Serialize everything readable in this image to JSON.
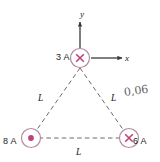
{
  "figure": {
    "background_color": "#ffffff",
    "line_color": "#5a5a5a",
    "symbol_color": "#c2407c",
    "circle_stroke_color": "#b58aa0",
    "text_color": "#1a1a1a",
    "handwriting_color": "#4a4a52"
  },
  "axes": {
    "y_label": "y",
    "x_label": "x",
    "origin_note": "axes originate at the top vertex wire"
  },
  "wires": [
    {
      "id": "top",
      "label": "3 A",
      "current": 3,
      "unit": "A",
      "direction_symbol": "x",
      "direction_meaning": "into the page",
      "position": "top vertex"
    },
    {
      "id": "bottom-left",
      "label": "8 A",
      "current": 8,
      "unit": "A",
      "direction_symbol": "dot",
      "direction_meaning": "out of the page",
      "position": "bottom-left vertex"
    },
    {
      "id": "bottom-right",
      "label": "6 A",
      "current": 6,
      "unit": "A",
      "direction_symbol": "x",
      "direction_meaning": "into the page",
      "position": "bottom-right vertex"
    }
  ],
  "sides": {
    "left_label": "L",
    "right_label": "L",
    "bottom_label": "L"
  },
  "annotations": [
    {
      "id": "handwritten-note",
      "text": "0,06",
      "style": "handwritten"
    }
  ]
}
